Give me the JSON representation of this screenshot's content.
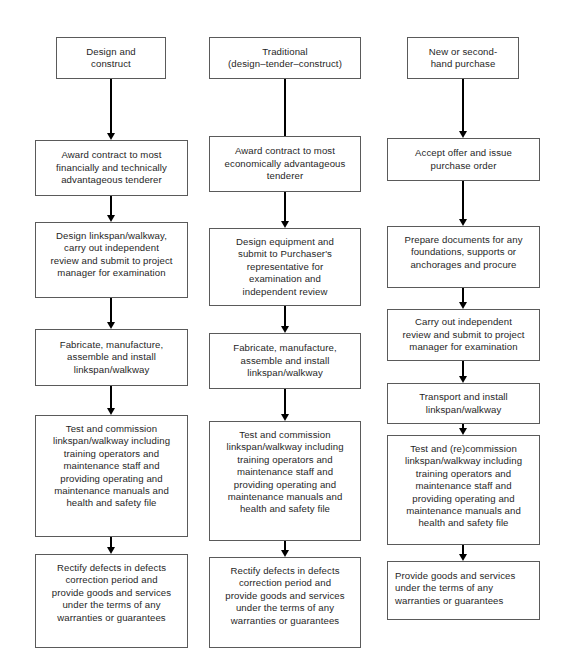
{
  "diagram": {
    "background_color": "#ffffff",
    "box_border_color": "#5a5a5a",
    "arrow_color": "#000000",
    "text_color": "#1f1f1f"
  },
  "columns": [
    {
      "id": "design-and-construct",
      "header": "Design and\nconstruct",
      "steps": [
        "Award contract to most\nfinancially and technically\nadvantageous tenderer",
        "Design linkspan/walkway,\ncarry out independent\nreview and submit to project\nmanager for examination",
        "Fabricate, manufacture,\nassemble and install\nlinkspan/walkway",
        "Test and commission\nlinkspan/walkway including\ntraining operators and\nmaintenance staff and\nproviding operating and\nmaintenance manuals and\nhealth and safety file",
        "Rectify defects in defects\ncorrection period and\nprovide goods and services\nunder the terms of any\nwarranties or guarantees"
      ]
    },
    {
      "id": "traditional",
      "header": "Traditional\n(design–tender–construct)",
      "steps": [
        "Award contract to most\neconomically advantageous\ntenderer",
        "Design equipment and\nsubmit to Purchaser's\nrepresentative for\nexamination and\nindependent review",
        "Fabricate, manufacture,\nassemble and install\nlinkspan/walkway",
        "Test and commission\nlinkspan/walkway including\ntraining operators and\nmaintenance staff and\nproviding operating and\nmaintenance manuals and\nhealth and safety file",
        "Rectify defects in defects\ncorrection period and\nprovide goods and services\nunder the terms of any\nwarranties or guarantees"
      ]
    },
    {
      "id": "new-or-second-hand-purchase",
      "header": "New or second-\nhand purchase",
      "steps": [
        "Accept offer and issue\npurchase order",
        "Prepare documents for any\nfoundations, supports or\nanchorages and procure",
        "Carry out independent\nreview and submit to project\nmanager for examination",
        "Transport and install\nlinkspan/walkway",
        "Test and (re)commission\nlinkspan/walkway including\ntraining operators and\nmaintenance staff and\nproviding operating and\nmaintenance manuals and\nhealth and safety file",
        "Provide goods and services\nunder the terms of any\nwarranties or guarantees"
      ]
    }
  ]
}
